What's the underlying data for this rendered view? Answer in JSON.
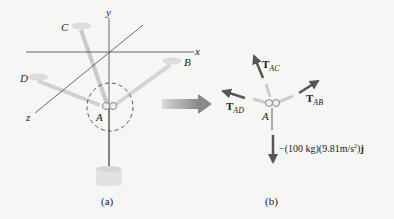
{
  "figure_a": {
    "caption": "(a)",
    "axes": {
      "x": "x",
      "y": "y",
      "z": "z"
    },
    "points": {
      "A": "A",
      "B": "B",
      "C": "C",
      "D": "D"
    }
  },
  "figure_b": {
    "caption": "(b)",
    "point": "A",
    "forces": {
      "T_AC": {
        "symbol": "T",
        "sub": "AC"
      },
      "T_AB": {
        "symbol": "T",
        "sub": "AB"
      },
      "T_AD": {
        "symbol": "T",
        "sub": "AD"
      },
      "weight": {
        "prefix": "−(100 kg)(9.81m/s",
        "exp": "2",
        "suffix": ")",
        "unit_vector": "j"
      }
    }
  },
  "colors": {
    "arrow": "#555555",
    "transition_arrow": "#9a9a9a",
    "ring": "#e0e0e0",
    "mass": "#e2e2e2"
  }
}
